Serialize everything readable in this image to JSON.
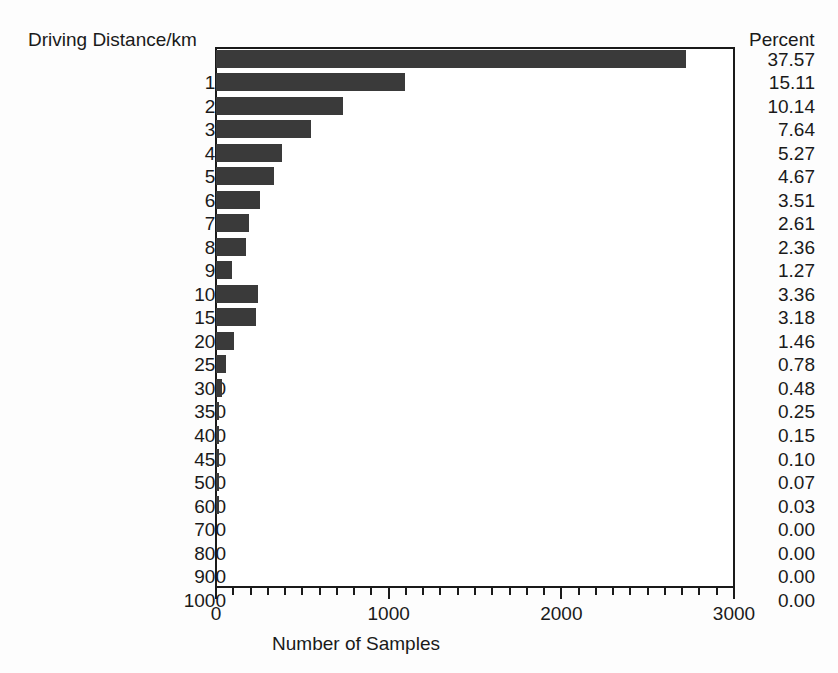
{
  "axes": {
    "y_title": "Driving Distance/km",
    "x_title": "Number of Samples",
    "percent_header": "Percent",
    "x_ticks": [
      "0",
      "1000",
      "2000",
      "3000"
    ]
  },
  "style": {
    "bar_color": "#3a3a3a",
    "axis_color": "#1a1a1a",
    "background": "#fdfdfd"
  },
  "chart_data": {
    "type": "bar",
    "orientation": "horizontal",
    "title": "",
    "xlabel": "Number of Samples",
    "ylabel": "Driving Distance/km",
    "xlim": [
      0,
      3000
    ],
    "xticks": [
      0,
      1000,
      2000,
      3000
    ],
    "minor_tick_interval": 100,
    "grid": false,
    "legend": null,
    "categories": [
      "0",
      "10",
      "20",
      "30",
      "40",
      "50",
      "60",
      "70",
      "80",
      "90",
      "100",
      "150",
      "200",
      "250",
      "300",
      "350",
      "400",
      "450",
      "500",
      "600",
      "700",
      "800",
      "900",
      "1000"
    ],
    "values": [
      2720,
      1094,
      734,
      553,
      382,
      338,
      254,
      189,
      171,
      92,
      243,
      230,
      106,
      56,
      35,
      18,
      11,
      7,
      5,
      2,
      0,
      0,
      0,
      0
    ],
    "percent_labels": [
      "37.57",
      "15.11",
      "10.14",
      "7.64",
      "5.27",
      "4.67",
      "3.51",
      "2.61",
      "2.36",
      "1.27",
      "3.36",
      "3.18",
      "1.46",
      "0.78",
      "0.48",
      "0.25",
      "0.15",
      "0.10",
      "0.07",
      "0.03",
      "0.00",
      "0.00",
      "0.00",
      "0.00"
    ],
    "percents": [
      37.57,
      15.11,
      10.14,
      7.64,
      5.27,
      4.67,
      3.51,
      2.61,
      2.36,
      1.27,
      3.36,
      3.18,
      1.46,
      0.78,
      0.48,
      0.25,
      0.15,
      0.1,
      0.07,
      0.03,
      0.0,
      0.0,
      0.0,
      0.0
    ]
  }
}
